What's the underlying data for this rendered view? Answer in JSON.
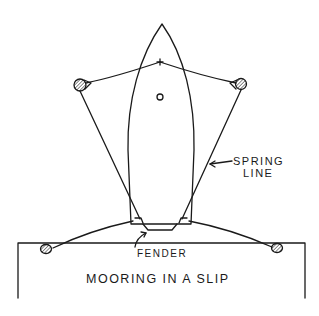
{
  "diagram": {
    "title": "MOORING IN A SLIP",
    "labels": {
      "spring_line_1": "SPRING",
      "spring_line_2": "LINE",
      "fender": "FENDER"
    },
    "colors": {
      "ink": "#1a1a1a",
      "background": "#ffffff"
    },
    "elements": [
      "boat-hull",
      "bow-line-cross",
      "mast-circle",
      "piling-top-left",
      "piling-top-right",
      "cleat-dock-left",
      "cleat-dock-right",
      "spring-line-left",
      "spring-line-right",
      "bow-lines",
      "stern-lines",
      "fender",
      "dock"
    ]
  }
}
